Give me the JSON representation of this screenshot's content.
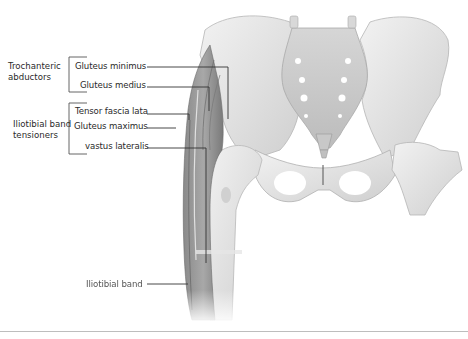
{
  "figure": {
    "groups": [
      {
        "id": "trochanteric",
        "label_line1": "Trochanteric",
        "label_line2": "abductors",
        "members": [
          "Gluteus minimus",
          "Gluteus medius"
        ]
      },
      {
        "id": "iliotibial",
        "label_line1": "Iliotibial band",
        "label_line2": "tensioners",
        "members": [
          "Tensor fascia lata",
          "Gluteus maximus",
          "vastus lateralis"
        ]
      }
    ],
    "labels": {
      "gluteus_minimus": "Gluteus minimus",
      "gluteus_medius": "Gluteus medius",
      "tensor_fascia_lata": "Tensor fascia lata",
      "gluteus_maximus": "Gluteus maximus",
      "vastus_lateralis": "vastus lateralis",
      "iliotibial_band": "Iliotibial band"
    },
    "colors": {
      "bone": "#e6e6e6",
      "bone_shadow": "#bdbdbd",
      "muscle": "#9a9a9a",
      "muscle_dark": "#6e6e6e",
      "leader_line": "#333333",
      "divider": "#bdbdbd"
    }
  }
}
